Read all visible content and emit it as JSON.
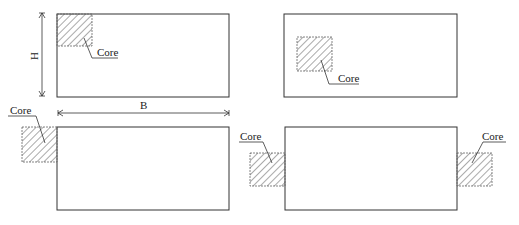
{
  "diagram": {
    "colors": {
      "stroke": "#333333",
      "hatch": "#555555",
      "background": "#ffffff"
    },
    "dimensions": {
      "height_label": "H",
      "width_label": "B"
    },
    "panels": [
      {
        "id": "corner-core",
        "core_label": "Core"
      },
      {
        "id": "interior-core",
        "core_label": "Core"
      },
      {
        "id": "external-corner-core",
        "core_label": "Core"
      },
      {
        "id": "two-side-external-cores",
        "core_labels": [
          "Core",
          "Core"
        ]
      }
    ]
  }
}
